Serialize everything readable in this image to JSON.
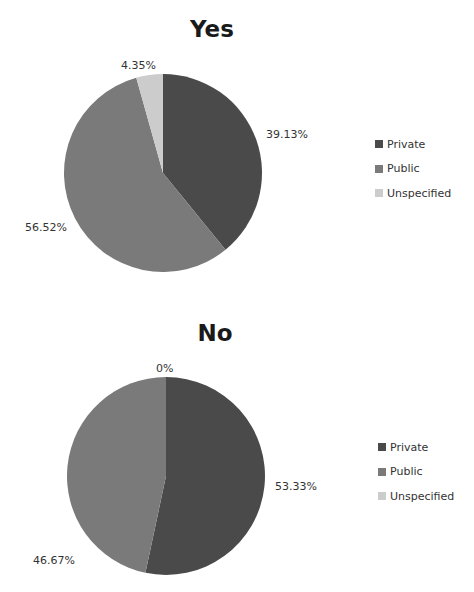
{
  "colors": {
    "Private": "#4a4a4a",
    "Public": "#7a7a7a",
    "Unspecified": "#cccccc"
  },
  "chart_data": [
    {
      "type": "pie",
      "title": "Yes",
      "categories": [
        "Private",
        "Public",
        "Unspecified"
      ],
      "values": [
        39.13,
        56.52,
        4.35
      ],
      "labels": [
        "39.13%",
        "56.52%",
        "4.35%"
      ],
      "legend": [
        "Private",
        "Public",
        "Unspecified"
      ],
      "legend_position": "right"
    },
    {
      "type": "pie",
      "title": "No",
      "categories": [
        "Private",
        "Public",
        "Unspecified"
      ],
      "values": [
        53.33,
        46.67,
        0
      ],
      "labels": [
        "53.33%",
        "46.67%",
        "0%"
      ],
      "legend": [
        "Private",
        "Public",
        "Unspecified"
      ],
      "legend_position": "right"
    }
  ]
}
